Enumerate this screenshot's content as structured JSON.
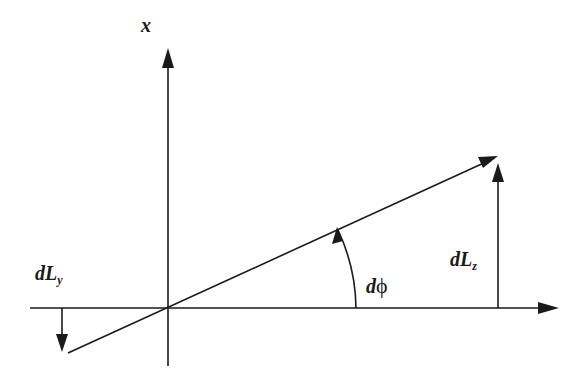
{
  "diagram": {
    "type": "vector-rotation-diagram",
    "labels": {
      "x_axis": "x",
      "dLy_main": "dL",
      "dLy_sub": "y",
      "dLz_main": "dL",
      "dLz_sub": "z",
      "dphi_d": "d",
      "dphi_phi": "ϕ"
    },
    "colors": {
      "ink": "#1a1a1a",
      "background": "#ffffff"
    }
  }
}
